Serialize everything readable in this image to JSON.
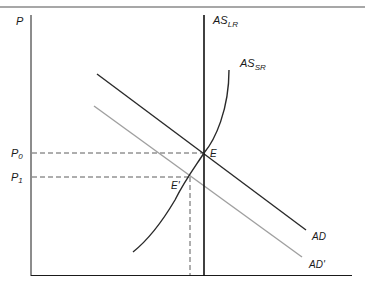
{
  "diagram": {
    "type": "aggregate supply / aggregate demand",
    "colors": {
      "axis": "#1a1a1a",
      "ad": "#2a2a2a",
      "ad_prime": "#a0a0a0",
      "as_lr": "#111111",
      "as_sr": "#2a2a2a",
      "dashed": "#333333",
      "top_rule": "#8a8a8a"
    },
    "axis": {
      "y_label": "P"
    },
    "curves": {
      "as_lr": {
        "base": "AS",
        "sub": "LR"
      },
      "as_sr": {
        "base": "AS",
        "sub": "SR"
      },
      "ad": {
        "label": "AD"
      },
      "ad_prime": {
        "label": "AD'"
      }
    },
    "prices": {
      "p0": {
        "base": "P",
        "sub": "0"
      },
      "p1": {
        "base": "P",
        "sub": "1"
      }
    },
    "points": {
      "e": {
        "label": "E"
      },
      "e_prime": {
        "label": "E'"
      }
    }
  }
}
